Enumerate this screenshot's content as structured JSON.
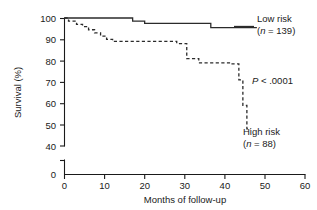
{
  "chart_data": {
    "type": "line",
    "subtype": "kaplan-meier-step",
    "title": "",
    "xlabel": "Months of follow-up",
    "ylabel": "Survival (%)",
    "xlim": [
      0,
      60
    ],
    "ylim": [
      40,
      100
    ],
    "y_axis_break": true,
    "y_break_labels": [
      "0"
    ],
    "xticks": [
      0,
      10,
      20,
      30,
      40,
      50,
      60
    ],
    "xtick_labels": [
      "0",
      "10",
      "20",
      "30",
      "40",
      "50",
      "60"
    ],
    "yticks": [
      40,
      50,
      60,
      70,
      80,
      90,
      100
    ],
    "ytick_labels": [
      "40",
      "50",
      "60",
      "70",
      "80",
      "90",
      "100"
    ],
    "grid": false,
    "legend_position": "right-inline",
    "series": [
      {
        "name": "Low risk",
        "n_label": "(n = 139)",
        "n": 139,
        "linestyle": "solid",
        "color": "#2b2b2b",
        "x": [
          0,
          17,
          17,
          20,
          20,
          36.5,
          36.5,
          48
        ],
        "y": [
          100,
          100,
          98.5,
          98.5,
          97.5,
          97.5,
          95.5,
          95.5
        ]
      },
      {
        "name": "High risk",
        "n_label": "(n = 88)",
        "n": 88,
        "linestyle": "dashed",
        "color": "#2b2b2b",
        "x": [
          0,
          1,
          1,
          3,
          3,
          4.5,
          4.5,
          6,
          6,
          7.5,
          7.5,
          9,
          9,
          10.5,
          10.5,
          12,
          12,
          28,
          28,
          30.5,
          30.5,
          33.5,
          33.5,
          41.5,
          41.5,
          43.5,
          43.5,
          44.5,
          44.5,
          45.5,
          45.5,
          46.5
        ],
        "y": [
          100,
          100,
          98.5,
          98.5,
          97,
          97,
          96,
          96,
          94.5,
          94.5,
          93,
          93,
          91.5,
          91.5,
          90,
          90,
          89,
          89,
          88,
          88,
          81,
          81,
          79,
          79,
          78.5,
          78.5,
          71,
          71,
          59,
          59,
          48,
          48
        ]
      }
    ],
    "annotations": [
      {
        "name": "p-value",
        "text": "P < .0001",
        "italic_prefix": "P",
        "x": 52,
        "y": 71
      }
    ]
  },
  "axes": {
    "y_label": "Survival (%)",
    "x_label": "Months of follow-up",
    "y_zero_label": "0"
  },
  "legend": {
    "low_risk": {
      "label": "Low risk",
      "n_label": "(n = 139)"
    },
    "high_risk": {
      "label": "High risk",
      "n_label": "(n = 88)"
    }
  },
  "stats": {
    "p_value_prefix": "P",
    "p_value_rest": "< .0001"
  }
}
